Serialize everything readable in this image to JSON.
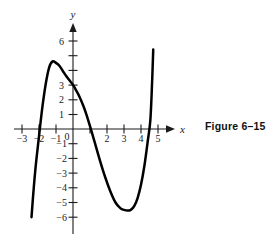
{
  "figure": {
    "caption": "Figure 6–15"
  },
  "axes": {
    "x_label": "x",
    "y_label": "y",
    "x_ticks": [
      {
        "value": -3,
        "label": "−3"
      },
      {
        "value": -2,
        "label": "−2"
      },
      {
        "value": -1,
        "label": "−1"
      },
      {
        "value": 0,
        "label": "0"
      },
      {
        "value": 1,
        "label": ""
      },
      {
        "value": 2,
        "label": "2"
      },
      {
        "value": 3,
        "label": "3"
      },
      {
        "value": 4,
        "label": "4"
      },
      {
        "value": 5,
        "label": "5"
      }
    ],
    "y_ticks": [
      {
        "value": 6,
        "label": "6"
      },
      {
        "value": 5,
        "label": ""
      },
      {
        "value": 4,
        "label": ""
      },
      {
        "value": 3,
        "label": "3"
      },
      {
        "value": 2,
        "label": "2"
      },
      {
        "value": 1,
        "label": "1"
      },
      {
        "value": -1,
        "label": "−1"
      },
      {
        "value": -2,
        "label": "−2"
      },
      {
        "value": -3,
        "label": "−3"
      },
      {
        "value": -4,
        "label": "−4"
      },
      {
        "value": -5,
        "label": "−5"
      },
      {
        "value": -6,
        "label": "−6"
      }
    ],
    "xlim": [
      -3.6,
      5.6
    ],
    "ylim": [
      -6.6,
      6.8
    ],
    "grid": false,
    "axis_color": "#1a1a1a"
  },
  "chart_data": {
    "type": "line",
    "title": "",
    "xlabel": "x",
    "ylabel": "y",
    "xlim": [
      -3.6,
      5.6
    ],
    "ylim": [
      -6.6,
      6.8
    ],
    "grid": false,
    "legend": null,
    "curve_color": "#000000",
    "series": [
      {
        "name": "curve",
        "x": [
          -2.44,
          -2.35,
          -2.2,
          -2.0,
          -1.8,
          -1.6,
          -1.4,
          -1.2,
          -1.0,
          -0.8,
          -0.6,
          -0.4,
          -0.2,
          0.0,
          0.2,
          0.4,
          0.6,
          0.8,
          1.05,
          1.3,
          1.6,
          1.9,
          2.2,
          2.5,
          2.8,
          3.0,
          3.2,
          3.4,
          3.6,
          3.8,
          4.0,
          4.2,
          4.4,
          4.55,
          4.65,
          4.72
        ],
        "y": [
          -6.0,
          -4.6,
          -2.6,
          -0.5,
          1.5,
          3.1,
          4.2,
          4.6,
          4.5,
          4.3,
          3.95,
          3.6,
          3.3,
          3.0,
          2.6,
          2.15,
          1.6,
          0.95,
          0.0,
          -1.0,
          -2.2,
          -3.3,
          -4.25,
          -5.0,
          -5.4,
          -5.5,
          -5.55,
          -5.5,
          -5.25,
          -4.7,
          -3.8,
          -2.5,
          -0.8,
          0.6,
          3.1,
          5.4
        ]
      }
    ],
    "features": {
      "local_maximum": {
        "x": -1.2,
        "y": 4.6
      },
      "local_minimum": {
        "x": 3.4,
        "y": -5.55
      },
      "y_intercept": {
        "x": 0,
        "y": 3.0
      },
      "x_intercepts": [
        -2.05,
        1.05,
        4.55
      ]
    }
  }
}
